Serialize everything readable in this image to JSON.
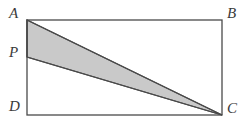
{
  "figure": {
    "kind": "geometry-diagram",
    "colors": {
      "background": "#ffffff",
      "stroke": "#4a4a4a",
      "shaded_fill": "#c9c9c9",
      "label_color": "#3a3a3a"
    },
    "rectangle": {
      "name": "ABCD",
      "corners": {
        "A": {
          "x": 27,
          "y": 20
        },
        "B": {
          "x": 222,
          "y": 20
        },
        "C": {
          "x": 222,
          "y": 115
        },
        "D": {
          "x": 27,
          "y": 115
        }
      },
      "stroke_width": 1.3
    },
    "point_P": {
      "x": 27,
      "y": 57,
      "on_segment": "AD"
    },
    "shaded_triangle": {
      "name": "APC",
      "vertices": [
        "A",
        "P",
        "C"
      ],
      "points": "27,20 27,57 222,115",
      "fill": "#c9c9c9",
      "stroke": "#4a4a4a",
      "stroke_width": 1.3
    },
    "labels": {
      "A": "A",
      "B": "B",
      "C": "C",
      "D": "D",
      "P": "P"
    }
  }
}
